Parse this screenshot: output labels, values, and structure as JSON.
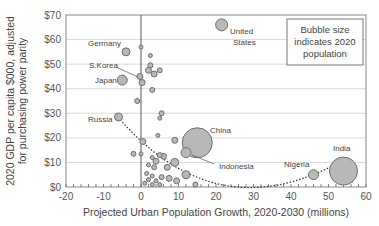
{
  "chart_data": {
    "type": "scatter",
    "subtype": "bubble",
    "title": "",
    "xlabel": "Projected Urban Population Growth, 2020-2030 (millions)",
    "ylabel": "2020 GDP per capita $000, adjusted for purchasing power parity",
    "ylabel_lines": [
      "2020 GDP per capita $000, adjusted",
      "for purchasing power parity"
    ],
    "xlim": [
      -20,
      60
    ],
    "ylim": [
      0,
      70
    ],
    "x_ticks": [
      "-20",
      "-10",
      "0",
      "10",
      "20",
      "30",
      "40",
      "50",
      "60"
    ],
    "y_ticks": [
      "$0",
      "$10",
      "$20",
      "$30",
      "$40",
      "$50",
      "$60",
      "$70"
    ],
    "grid": "horizontal",
    "annotation_box": [
      "Bubble size",
      "indicates 2020",
      "population"
    ],
    "trendline": "dotted polynomial, from Russia (~-6, 29) dipping to ~(30, 3) and rising to India (~53, 10)",
    "labeled_points": [
      {
        "name": "United States",
        "label_lines": [
          "United",
          "States"
        ],
        "x": 21.5,
        "y": 66,
        "r": 6
      },
      {
        "name": "Germany",
        "x": -4,
        "y": 55,
        "r": 4
      },
      {
        "name": "S.Korea",
        "x": -0.3,
        "y": 45,
        "r": 3
      },
      {
        "name": "Japan",
        "x": -5,
        "y": 43.5,
        "r": 5
      },
      {
        "name": "Russia",
        "x": -6,
        "y": 28.5,
        "r": 4
      },
      {
        "name": "China",
        "x": 15,
        "y": 18,
        "r": 15
      },
      {
        "name": "Indonesia",
        "x": 12,
        "y": 14,
        "r": 5
      },
      {
        "name": "Nigeria",
        "x": 46,
        "y": 5,
        "r": 5
      },
      {
        "name": "India",
        "x": 54,
        "y": 6.5,
        "r": 14
      }
    ],
    "other_points": [
      {
        "x": 0,
        "y": 57,
        "r": 2
      },
      {
        "x": 2.5,
        "y": 53.5,
        "r": 2
      },
      {
        "x": 2.5,
        "y": 49.5,
        "r": 2.5
      },
      {
        "x": 2,
        "y": 47.5,
        "r": 3
      },
      {
        "x": 3.5,
        "y": 46,
        "r": 3
      },
      {
        "x": 5,
        "y": 47.5,
        "r": 2.5
      },
      {
        "x": 0.3,
        "y": 42.5,
        "r": 3
      },
      {
        "x": 3,
        "y": 39.5,
        "r": 2.5
      },
      {
        "x": -1,
        "y": 35,
        "r": 2.5
      },
      {
        "x": 5.5,
        "y": 30,
        "r": 2.5
      },
      {
        "x": 5,
        "y": 28,
        "r": 2
      },
      {
        "x": 0.5,
        "y": 18.5,
        "r": 3
      },
      {
        "x": 4.5,
        "y": 21,
        "r": 2
      },
      {
        "x": 9,
        "y": 19,
        "r": 3
      },
      {
        "x": -2,
        "y": 13.5,
        "r": 2.5
      },
      {
        "x": 0,
        "y": 13.5,
        "r": 2
      },
      {
        "x": 3,
        "y": 12,
        "r": 2
      },
      {
        "x": 4,
        "y": 10.5,
        "r": 3
      },
      {
        "x": 5,
        "y": 13,
        "r": 2.5
      },
      {
        "x": 6,
        "y": 12.5,
        "r": 3
      },
      {
        "x": 2,
        "y": 9,
        "r": 2
      },
      {
        "x": 3.5,
        "y": 8,
        "r": 2.5
      },
      {
        "x": 7,
        "y": 8,
        "r": 3
      },
      {
        "x": 9,
        "y": 10,
        "r": 4
      },
      {
        "x": 1.5,
        "y": 5.5,
        "r": 2
      },
      {
        "x": 3,
        "y": 4.5,
        "r": 2
      },
      {
        "x": 2,
        "y": 3,
        "r": 2
      },
      {
        "x": 4,
        "y": 2.5,
        "r": 2
      },
      {
        "x": 5.5,
        "y": 4,
        "r": 2.5
      },
      {
        "x": 7.5,
        "y": 3.5,
        "r": 3
      },
      {
        "x": 9.5,
        "y": 2.5,
        "r": 3
      },
      {
        "x": 12,
        "y": 5,
        "r": 4
      },
      {
        "x": 1,
        "y": 1.5,
        "r": 2
      },
      {
        "x": 3,
        "y": 1,
        "r": 2
      },
      {
        "x": 5,
        "y": 1,
        "r": 2
      },
      {
        "x": 14.5,
        "y": 1,
        "r": 2.5
      }
    ]
  },
  "colors": {
    "bubble_fill": "#b8b8b8",
    "bubble_stroke": "#6e6e6e",
    "gridline": "#d9d9d9",
    "axis": "#666666",
    "trendline": "#333333"
  }
}
